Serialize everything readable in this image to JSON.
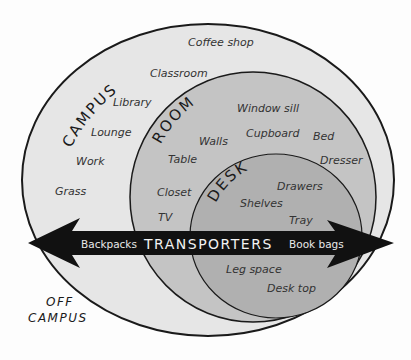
{
  "diagram": {
    "colors": {
      "background": "#fdfdfd",
      "campus_fill": "#e6e6e6",
      "room_fill": "#c4c4c4",
      "desk_fill": "#b0b0b0",
      "stroke": "#1a1a1a",
      "arrow": "#111111"
    },
    "regions": {
      "campus": {
        "title": "CAMPUS",
        "items": [
          "Coffee shop",
          "Classroom",
          "Library",
          "Lounge",
          "Work",
          "Grass"
        ]
      },
      "room": {
        "title": "ROOM",
        "items": [
          "Window sill",
          "Cupboard",
          "Walls",
          "Table",
          "Bed",
          "Dresser",
          "Closet",
          "TV"
        ]
      },
      "desk": {
        "title": "DESK",
        "items": [
          "Drawers",
          "Shelves",
          "Tray",
          "Leg space",
          "Desk top"
        ]
      }
    },
    "arrow": {
      "title": "TRANSPORTERS",
      "left_label": "Backpacks",
      "right_label": "Book bags"
    },
    "outside": {
      "line1": "OFF",
      "line2": "CAMPUS"
    }
  }
}
